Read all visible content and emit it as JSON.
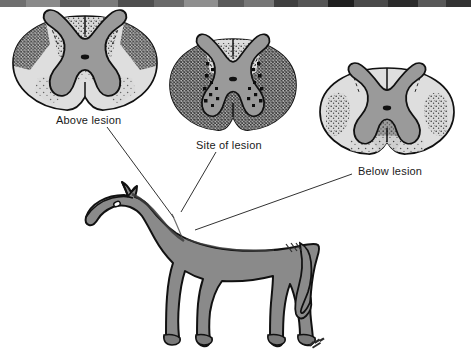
{
  "figure": {
    "background_color": "#ffffff",
    "width": 471,
    "height": 362
  },
  "scan_artifact": {
    "present": true,
    "description": "dark scanned page-edge band across top of image",
    "bands": [
      {
        "x": 0,
        "width": 26,
        "color": "#6f6f6f"
      },
      {
        "x": 26,
        "width": 34,
        "color": "#8a8a8a"
      },
      {
        "x": 60,
        "width": 30,
        "color": "#5e5e5e"
      },
      {
        "x": 90,
        "width": 28,
        "color": "#7b7b7b"
      },
      {
        "x": 118,
        "width": 36,
        "color": "#4f4f4f"
      },
      {
        "x": 154,
        "width": 30,
        "color": "#6a6a6a"
      },
      {
        "x": 184,
        "width": 34,
        "color": "#8f8f8f"
      },
      {
        "x": 218,
        "width": 26,
        "color": "#5a5a5a"
      },
      {
        "x": 244,
        "width": 30,
        "color": "#767676"
      },
      {
        "x": 274,
        "width": 24,
        "color": "#3f3f3f"
      },
      {
        "x": 298,
        "width": 30,
        "color": "#555555"
      },
      {
        "x": 328,
        "width": 26,
        "color": "#1f1f1f"
      },
      {
        "x": 354,
        "width": 34,
        "color": "#4a4a4a"
      },
      {
        "x": 388,
        "width": 30,
        "color": "#2b2b2b"
      },
      {
        "x": 418,
        "width": 28,
        "color": "#585858"
      },
      {
        "x": 446,
        "width": 25,
        "color": "#333333"
      }
    ]
  },
  "colors": {
    "outline": "#111111",
    "white_matter": "#d9d9d9",
    "gray_matter": "#9a9a9a",
    "stipple": "#2a2a2a",
    "lesion_mark": "#0d0d0d",
    "horse_body": "#8a8a8a",
    "horse_shadow": "#6e6e6e",
    "leader_line": "#1a1a1a",
    "label_text": "#1a1a1a"
  },
  "sections": [
    {
      "id": "above",
      "label": "Above lesion",
      "label_position": {
        "x": 56,
        "y": 114
      },
      "center": {
        "x": 85,
        "y": 63
      },
      "radius": {
        "rx": 72,
        "ry": 47
      },
      "degeneration": "moderate stippling in dorsal columns and dorsolateral white matter",
      "stipple_density": "medium",
      "has_lesion_marks": false
    },
    {
      "id": "site",
      "label": "Site of lesion",
      "label_position": {
        "x": 196,
        "y": 139
      },
      "center": {
        "x": 233,
        "y": 85
      },
      "radius": {
        "rx": 63,
        "ry": 46
      },
      "degeneration": "dense dark stippling throughout white matter with black lesion foci bordering gray matter",
      "stipple_density": "high",
      "has_lesion_marks": true
    },
    {
      "id": "below",
      "label": "Below lesion",
      "label_position": {
        "x": 358,
        "y": 165
      },
      "center": {
        "x": 387,
        "y": 112
      },
      "radius": {
        "rx": 67,
        "ry": 44
      },
      "degeneration": "stippling in lateral and ventral white matter columns",
      "stipple_density": "low",
      "has_lesion_marks": false
    }
  ],
  "leader_lines": [
    {
      "id": "above-leader",
      "label": "Above lesion",
      "from": {
        "x": 107,
        "y": 127
      },
      "to": {
        "x": 174,
        "y": 218
      }
    },
    {
      "id": "site-leader",
      "label": "Site of lesion",
      "from": {
        "x": 216,
        "y": 152
      },
      "to": {
        "x": 181,
        "y": 212
      }
    },
    {
      "id": "below-leader",
      "label": "Below lesion",
      "from": {
        "x": 352,
        "y": 174
      },
      "to": {
        "x": 195,
        "y": 230
      }
    }
  ],
  "horse": {
    "id": "horse-illustration",
    "description": "gray horse standing in left-facing profile",
    "facing": "left",
    "body_color": "#8a8a8a",
    "outline_color": "#111111",
    "signature": {
      "present": true,
      "x": 312,
      "y": 343,
      "description": "artist signature initials"
    }
  }
}
